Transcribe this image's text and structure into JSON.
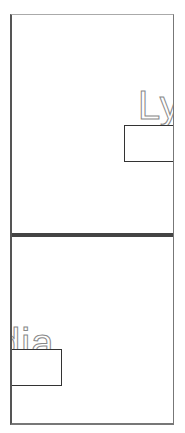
{
  "top_panel": {
    "name_fragment": "Ly"
  },
  "bottom_panel": {
    "name_fragment": "dia"
  },
  "colors": {
    "frame": "#555555",
    "divider": "#444444",
    "text_outline": "#888888",
    "background": "#ffffff"
  }
}
